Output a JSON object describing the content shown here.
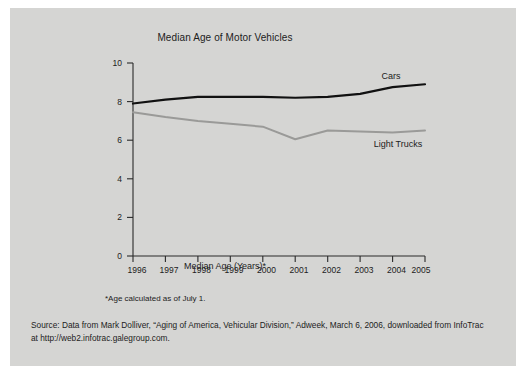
{
  "figure": {
    "background_color": "#d5d5d3",
    "page_background": "#ffffff"
  },
  "chart_data": {
    "type": "line",
    "title": "Median Age of Motor Vehicles",
    "xlabel": "Median Age (Years)*",
    "ylabel": "",
    "x": [
      1996,
      1997,
      1998,
      1999,
      2000,
      2001,
      2002,
      2003,
      2004,
      2005
    ],
    "categories": [
      "1996",
      "1997",
      "1998",
      "1999",
      "2000",
      "2001",
      "2002",
      "2003",
      "2004",
      "2005"
    ],
    "xlim": [
      1996,
      2005
    ],
    "ylim": [
      0,
      10
    ],
    "yticks": [
      0,
      2,
      4,
      6,
      8,
      10
    ],
    "ytick_labels": [
      "0",
      "2",
      "4",
      "6",
      "8",
      "10"
    ],
    "grid": false,
    "legend_position": "inline-end-of-line",
    "series": [
      {
        "name": "Cars",
        "color": "#111111",
        "line_width": 2.2,
        "values": [
          7.9,
          8.1,
          8.25,
          8.25,
          8.25,
          8.2,
          8.25,
          8.4,
          8.75,
          8.9
        ]
      },
      {
        "name": "Light Trucks",
        "color": "#9a9a98",
        "line_width": 2.0,
        "values": [
          7.45,
          7.2,
          7.0,
          6.85,
          6.7,
          6.05,
          6.5,
          6.45,
          6.4,
          6.5
        ]
      }
    ]
  },
  "labels": {
    "cars": "Cars",
    "light_trucks": "Light Trucks"
  },
  "footnote": "*Age calculated as of July 1.",
  "source": {
    "line1": "Source: Data from Mark Dolliver, “Aging of America, Vehicular Division,” Adweek, March 6, 2006, downloaded from InfoTrac",
    "line2": "at http://web2.infotrac.galegroup.com."
  }
}
